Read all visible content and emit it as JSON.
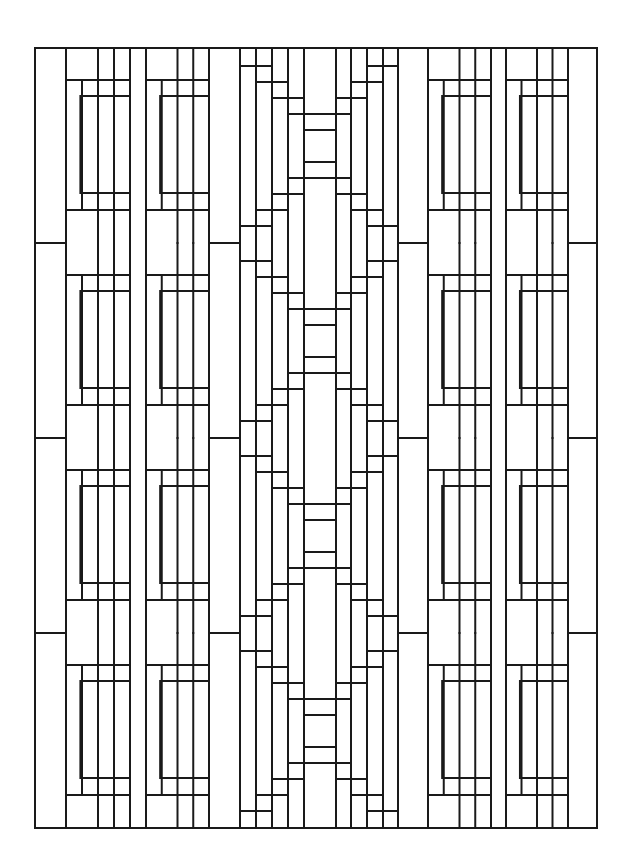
{
  "artwork": {
    "description": "Geometric stained-glass style line pattern (coloring page)",
    "stroke_color": "#1a1a1a",
    "background": "#ffffff",
    "frame": {
      "x1": 35,
      "y1": 48,
      "x2": 597,
      "y2": 828
    },
    "tile_period": 195,
    "tile_starts": [
      48,
      243,
      438,
      633
    ],
    "verticals": [
      35,
      66,
      82,
      99,
      114,
      130,
      146,
      162,
      178,
      194,
      209,
      240,
      256,
      272,
      288,
      304,
      336,
      351,
      367,
      383,
      398,
      428,
      444,
      460,
      475,
      491,
      506,
      521,
      537,
      553,
      568,
      597
    ],
    "panel_left_a": {
      "x1": 66,
      "x2": 130
    },
    "panel_left_b": {
      "x1": 146,
      "x2": 209
    },
    "panel_right_a": {
      "x1": 428,
      "x2": 491
    },
    "panel_right_b": {
      "x1": 506,
      "x2": 568
    },
    "center_column": {
      "x1": 288,
      "x2": 351
    }
  }
}
